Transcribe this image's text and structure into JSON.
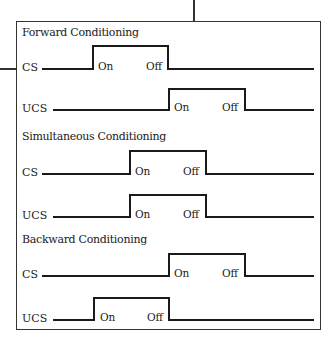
{
  "sections": [
    {
      "title": "Forward Conditioning",
      "rows": [
        {
          "label": "CS",
          "on": "On",
          "off": "Off"
        },
        {
          "label": "UCS",
          "on": "On",
          "off": "Off"
        }
      ]
    },
    {
      "title": "Simultaneous Conditioning",
      "rows": [
        {
          "label": "CS",
          "on": "On",
          "off": "Off"
        },
        {
          "label": "UCS",
          "on": "On",
          "off": "Off"
        }
      ]
    },
    {
      "title": "Backward Conditioning",
      "rows": [
        {
          "label": "CS",
          "on": "On",
          "off": "Off"
        },
        {
          "label": "UCS",
          "on": "On",
          "off": "Off"
        }
      ]
    }
  ],
  "colors": {
    "line": "#1a1a1a",
    "border": "#333333"
  }
}
